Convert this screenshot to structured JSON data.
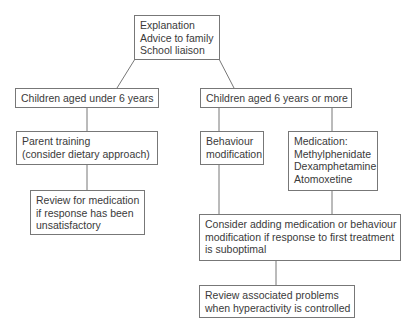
{
  "diagram": {
    "type": "flowchart",
    "nodes": {
      "root": {
        "lines": [
          "Explanation",
          "Advice to family",
          "School liaison"
        ]
      },
      "under6": {
        "lines": [
          "Children aged under 6 years"
        ]
      },
      "over6": {
        "lines": [
          "Children aged 6 years or more"
        ]
      },
      "parent_training": {
        "lines": [
          "Parent training",
          "(consider dietary approach)"
        ]
      },
      "review_medication": {
        "lines": [
          "Review for medication",
          "if response has been",
          "unsatisfactory"
        ]
      },
      "behaviour": {
        "lines": [
          "Behaviour",
          "modification"
        ]
      },
      "medication": {
        "lines": [
          "Medication:",
          "Methylphenidate",
          "Dexamphetamine",
          "Atomoxetine"
        ]
      },
      "consider": {
        "lines": [
          "Consider adding medication or behaviour",
          "modification if response to first treatment",
          "is suboptimal"
        ]
      },
      "review_problems": {
        "lines": [
          "Review associated problems",
          "when hyperactivity is controlled"
        ]
      }
    },
    "edges": [
      [
        "root",
        "under6"
      ],
      [
        "root",
        "over6"
      ],
      [
        "under6",
        "parent_training"
      ],
      [
        "parent_training",
        "review_medication"
      ],
      [
        "over6",
        "behaviour"
      ],
      [
        "over6",
        "medication"
      ],
      [
        "behaviour",
        "consider"
      ],
      [
        "medication",
        "consider"
      ],
      [
        "consider",
        "review_problems"
      ]
    ],
    "colors": {
      "line": "#777777",
      "text": "#3a3a3a",
      "background": "#ffffff"
    }
  }
}
